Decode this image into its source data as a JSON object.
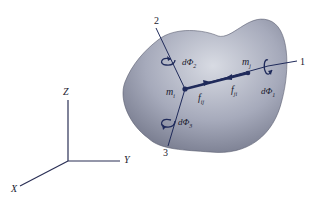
{
  "diagram": {
    "type": "rigid-body-particles-free-body",
    "colors": {
      "body_fill_light": "#c9ccd6",
      "body_fill_dark": "#7b7f92",
      "line": "#1f2a5a",
      "axis": "#2a2f55"
    },
    "global_axes": {
      "z_label": "Z",
      "y_label": "Y",
      "x_label": "X"
    },
    "local_axes": {
      "axis1_label": "1",
      "axis2_label": "2",
      "axis3_label": "3"
    },
    "particles": {
      "mi": "m",
      "mi_sub": "i",
      "mj": "m",
      "mj_sub": "j"
    },
    "forces": {
      "fij": "f",
      "fij_sub": "ij",
      "fji": "f",
      "fji_sub": "ji"
    },
    "rotations": {
      "dphi1": "dΦ",
      "dphi1_sub": "1",
      "dphi2": "dΦ",
      "dphi2_sub": "2",
      "dphi3": "dΦ",
      "dphi3_sub": "3"
    }
  }
}
